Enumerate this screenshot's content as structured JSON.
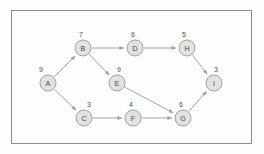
{
  "figure": {
    "frame": {
      "x": 11,
      "y": 10,
      "width": 241,
      "height": 134
    },
    "colors": {
      "background": "#fdfdfd",
      "frame_stroke": "#8d8d8d",
      "node_fill": "#e2e2e2",
      "node_stroke": "#9a9a9a",
      "edge_stroke": "#9e9e9e",
      "text": "#4a4a4a"
    }
  },
  "graph_data": {
    "type": "diagram",
    "graph_type": "directed-acyclic-graph",
    "node_radius": 8,
    "nodes": [
      {
        "id": "A",
        "label": "A",
        "weight": "9",
        "cx": 48,
        "cy": 83,
        "weight_x": 41,
        "weight_y": 69
      },
      {
        "id": "B",
        "label": "B",
        "weight": "7",
        "cx": 83,
        "cy": 48,
        "weight_x": 81,
        "weight_y": 34
      },
      {
        "id": "C",
        "label": "C",
        "weight": "3",
        "cx": 84,
        "cy": 118,
        "weight_x": 89,
        "weight_y": 104
      },
      {
        "id": "D",
        "label": "D",
        "weight": "6",
        "cx": 135,
        "cy": 48,
        "weight_x": 133,
        "weight_y": 34
      },
      {
        "id": "E",
        "label": "E",
        "weight": "9",
        "cx": 117,
        "cy": 83,
        "weight_x": 119,
        "weight_y": 69
      },
      {
        "id": "F",
        "label": "F",
        "weight": "4",
        "cx": 133,
        "cy": 118,
        "weight_x": 131,
        "weight_y": 104
      },
      {
        "id": "G",
        "label": "G",
        "weight": "6",
        "cx": 183,
        "cy": 118,
        "weight_x": 181,
        "weight_y": 104
      },
      {
        "id": "H",
        "label": "H",
        "weight": "5",
        "cx": 187,
        "cy": 48,
        "weight_x": 184,
        "weight_y": 34
      },
      {
        "id": "I",
        "label": "I",
        "weight": "3",
        "cx": 214,
        "cy": 83,
        "weight_x": 216,
        "weight_y": 69
      }
    ],
    "edges": [
      {
        "from": "A",
        "to": "B"
      },
      {
        "from": "A",
        "to": "C"
      },
      {
        "from": "B",
        "to": "D"
      },
      {
        "from": "B",
        "to": "E"
      },
      {
        "from": "C",
        "to": "F"
      },
      {
        "from": "D",
        "to": "H"
      },
      {
        "from": "E",
        "to": "G"
      },
      {
        "from": "F",
        "to": "G"
      },
      {
        "from": "G",
        "to": "I"
      },
      {
        "from": "H",
        "to": "I"
      }
    ]
  }
}
